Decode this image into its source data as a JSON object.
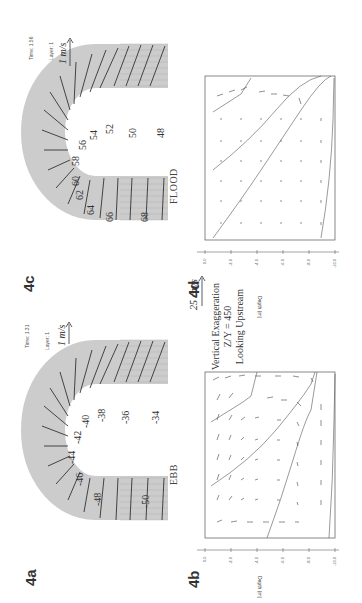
{
  "figure": {
    "orientation": "rotated 90 degrees counter-clockwise",
    "panels": {
      "4c": {
        "label": "4c",
        "tide": "FLOOD",
        "time": "Time: 1.56",
        "layer": "Layer: 1",
        "scale": "1 m/s",
        "contour_labels": [
          "48",
          "50",
          "52",
          "54",
          "56",
          "58",
          "60",
          "62",
          "64",
          "66",
          "68"
        ]
      },
      "4d": {
        "label": "4d",
        "axis_title": "Depth (m)",
        "ticks": [
          "0.0",
          "-2.0",
          "-4.0",
          "-6.0",
          "-8.0",
          "-10.0"
        ]
      },
      "4a": {
        "label": "4a",
        "tide": "EBB",
        "time": "Time: 1.31",
        "layer": "Layer: 1",
        "scale": "1 m/s",
        "contour_labels": [
          "-34",
          "-36",
          "-38",
          "-40",
          "-42",
          "-44",
          "-46",
          "-48",
          "-50"
        ]
      },
      "4b": {
        "label": "4b",
        "axis_title": "Depth (m)",
        "ticks": [
          "0.0",
          "-2.0",
          "-4.0",
          "-6.0",
          "-8.0",
          "-10.0"
        ]
      }
    },
    "legend": {
      "scale": "25 cm/s",
      "line1": "Vertical Exaggeration",
      "line2": "Z/Y = 450",
      "line3": "Looking Upstream"
    }
  }
}
